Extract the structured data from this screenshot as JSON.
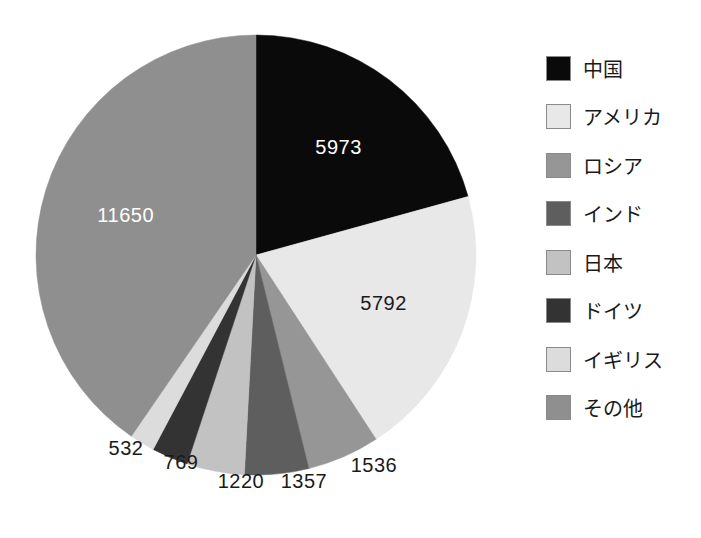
{
  "chart_data": {
    "type": "pie",
    "title": "",
    "categories": [
      "中国",
      "アメリカ",
      "ロシア",
      "インド",
      "日本",
      "ドイツ",
      "イギリス",
      "その他"
    ],
    "values": [
      5973,
      5792,
      1536,
      1357,
      1220,
      769,
      532,
      11650
    ],
    "total": 28829,
    "start_angle_deg": 0,
    "direction": "clockwise",
    "legend_position": "right",
    "grid": false,
    "slices": [
      {
        "label": "中国",
        "value": 5973,
        "value_text": "5973",
        "color": "#0a0a0a",
        "label_color": "#ffffff",
        "label_placement": "inside"
      },
      {
        "label": "アメリカ",
        "value": 5792,
        "value_text": "5792",
        "color": "#e8e8e8",
        "label_color": "#1a1a1a",
        "label_placement": "inside"
      },
      {
        "label": "ロシア",
        "value": 1536,
        "value_text": "1536",
        "color": "#969696",
        "label_color": "#1a1a1a",
        "label_placement": "outside"
      },
      {
        "label": "インド",
        "value": 1357,
        "value_text": "1357",
        "color": "#5e5e5e",
        "label_color": "#1a1a1a",
        "label_placement": "outside"
      },
      {
        "label": "日本",
        "value": 1220,
        "value_text": "1220",
        "color": "#c2c2c2",
        "label_color": "#1a1a1a",
        "label_placement": "outside"
      },
      {
        "label": "ドイツ",
        "value": 769,
        "value_text": "769",
        "color": "#333333",
        "label_color": "#1a1a1a",
        "label_placement": "outside"
      },
      {
        "label": "イギリス",
        "value": 532,
        "value_text": "532",
        "color": "#dcdcdc",
        "label_color": "#1a1a1a",
        "label_placement": "outside"
      },
      {
        "label": "その他",
        "value": 11650,
        "value_text": "11650",
        "color": "#8f8f8f",
        "label_color": "#ffffff",
        "label_placement": "inside"
      }
    ]
  },
  "legend": {
    "items": [
      {
        "label": "中国",
        "color": "#0a0a0a"
      },
      {
        "label": "アメリカ",
        "color": "#e8e8e8"
      },
      {
        "label": "ロシア",
        "color": "#969696"
      },
      {
        "label": "インド",
        "color": "#5e5e5e"
      },
      {
        "label": "日本",
        "color": "#c2c2c2"
      },
      {
        "label": "ドイツ",
        "color": "#333333"
      },
      {
        "label": "イギリス",
        "color": "#dcdcdc"
      },
      {
        "label": "その他",
        "color": "#8f8f8f"
      }
    ]
  },
  "geometry": {
    "center_x": 256,
    "center_y": 255,
    "radius": 220
  }
}
